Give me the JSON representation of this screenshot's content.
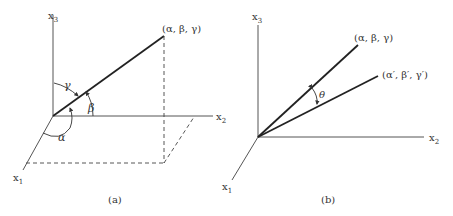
{
  "panel_a": {
    "caption": "(a)",
    "axes": {
      "x1": "x",
      "x1_sub": "1",
      "x2": "x",
      "x2_sub": "2",
      "x3": "x",
      "x3_sub": "3"
    },
    "point_label": "(α, β, γ)",
    "angles": {
      "alpha": "α",
      "beta": "β",
      "gamma": "γ"
    }
  },
  "panel_b": {
    "caption": "(b)",
    "axes": {
      "x1": "x",
      "x1_sub": "1",
      "x2": "x",
      "x2_sub": "2",
      "x3": "x",
      "x3_sub": "3"
    },
    "point1_label": "(α, β, γ)",
    "point2_label": "(α′, β′, γ′)",
    "angle": "θ"
  }
}
